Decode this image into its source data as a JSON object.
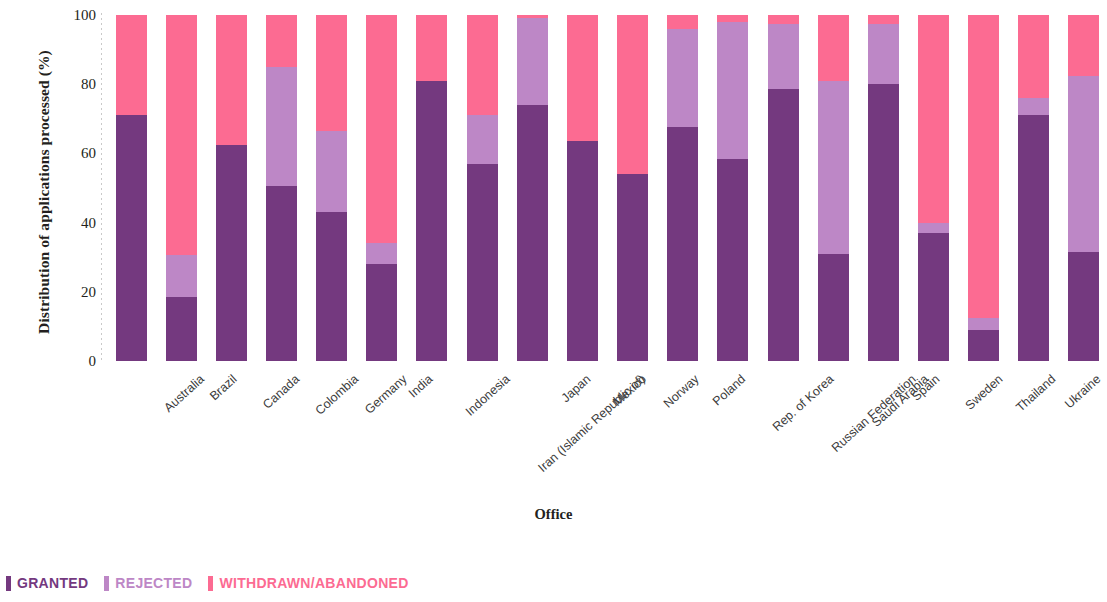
{
  "chart_data": {
    "type": "bar",
    "subtype": "stacked-100-percent",
    "title": "",
    "xlabel": "Office",
    "ylabel": "Distribution of applications processed (%)",
    "ylim": [
      0,
      100
    ],
    "yticks": [
      0,
      20,
      40,
      60,
      80,
      100
    ],
    "ytick_labels": [
      "0",
      "20",
      "40",
      "60",
      "80",
      "100"
    ],
    "grid": false,
    "legend_position": "bottom-left",
    "categories": [
      "Australia",
      "Brazil",
      "Canada",
      "Colombia",
      "Germany",
      "India",
      "Indonesia",
      "Iran (Islamic Republic of)",
      "Japan",
      "Mexico",
      "Norway",
      "Poland",
      "Rep. of Korea",
      "Russian Federation",
      "Saudi Arabia",
      "Spain",
      "Sweden",
      "Thailand",
      "Ukraine",
      "U.S."
    ],
    "series": [
      {
        "name": "GRANTED",
        "color": "#74397f",
        "values": [
          71,
          18.5,
          62.5,
          50.5,
          43,
          28,
          81,
          57,
          74,
          63.5,
          54,
          67.5,
          58.5,
          78.5,
          31,
          80,
          37,
          9,
          71,
          31.5
        ]
      },
      {
        "name": "REJECTED",
        "color": "#bd87c6",
        "values": [
          0,
          12,
          0,
          34.5,
          23.5,
          6,
          0,
          14,
          25,
          0,
          0,
          28.5,
          39.5,
          19,
          50,
          17.5,
          3,
          3.5,
          5,
          51
        ]
      },
      {
        "name": "WITHDRAWN/ABANDONED",
        "color": "#fc6b92",
        "values": [
          29,
          69.5,
          37.5,
          15,
          33.5,
          66,
          19,
          29,
          1,
          36.5,
          46,
          4,
          2,
          2.5,
          19,
          2.5,
          60,
          87.5,
          24,
          17.5
        ]
      }
    ]
  },
  "legend": {
    "items": [
      {
        "label": "GRANTED",
        "color": "#74397f"
      },
      {
        "label": "REJECTED",
        "color": "#bd87c6"
      },
      {
        "label": "WITHDRAWN/ABANDONED",
        "color": "#fc6b92"
      }
    ]
  }
}
